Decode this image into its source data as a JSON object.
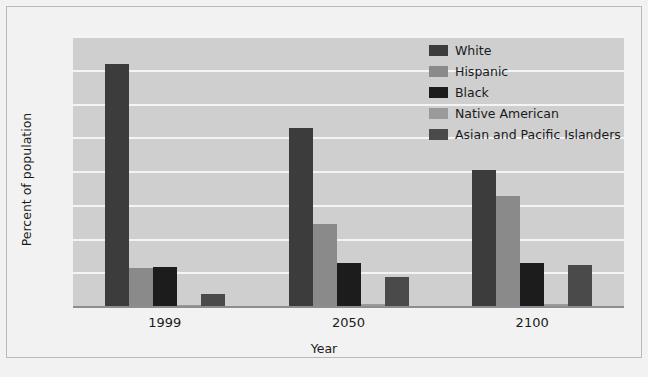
{
  "chart_data": {
    "type": "bar",
    "title": "",
    "xlabel": "Year",
    "ylabel": "Percent of population",
    "categories": [
      "1999",
      "2050",
      "2100"
    ],
    "ylim": [
      0,
      80
    ],
    "yticks": [
      0,
      10,
      20,
      30,
      40,
      50,
      60,
      70,
      80
    ],
    "grid": true,
    "legend_position": "top-right",
    "series": [
      {
        "name": "White",
        "color": "#3c3c3c",
        "values": [
          72,
          53,
          40.5
        ]
      },
      {
        "name": "Hispanic",
        "color": "#8a8a8a",
        "values": [
          11.5,
          24.5,
          33
        ]
      },
      {
        "name": "Black",
        "color": "#1c1c1c",
        "values": [
          12,
          13,
          13
        ]
      },
      {
        "name": "Native American",
        "color": "#9a9a9a",
        "values": [
          0.7,
          0.8,
          1
        ]
      },
      {
        "name": "Asian and Pacific Islanders",
        "color": "#4a4a4a",
        "values": [
          4,
          9,
          12.5
        ]
      }
    ]
  },
  "axis": {
    "y_tick_labels": [
      "80",
      "70",
      "60",
      "50",
      "40",
      "30",
      "20",
      "10",
      "0"
    ],
    "y_axis_title": "Percent of population",
    "x_tick_labels": [
      "1999",
      "2050",
      "2100"
    ],
    "x_axis_title": "Year"
  },
  "legend": {
    "items": [
      {
        "label": "White",
        "color": "#3c3c3c"
      },
      {
        "label": "Hispanic",
        "color": "#8a8a8a"
      },
      {
        "label": "Black",
        "color": "#1c1c1c"
      },
      {
        "label": "Native American",
        "color": "#9a9a9a"
      },
      {
        "label": "Asian and Pacific Islanders",
        "color": "#4a4a4a"
      }
    ]
  },
  "style": {
    "plot_background": "#cfcfcf",
    "figure_background": "#f2f2f2",
    "gridline_color": "#f4f4f4",
    "border_color": "#b9b9b9",
    "text_color": "#1a1a1a"
  }
}
